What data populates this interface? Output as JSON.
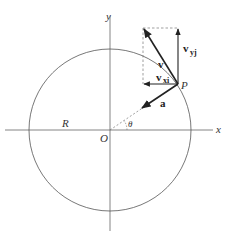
{
  "diagram": {
    "type": "circular-motion-vector-diagram",
    "colors": {
      "line": "#555555",
      "vector": "#222222",
      "dashed": "#777777",
      "background": "#ffffff"
    },
    "labels": {
      "x_axis": "x",
      "y_axis": "y",
      "origin": "O",
      "radius": "R",
      "angle": "θ",
      "point": "P",
      "velocity": "v",
      "velocity_x": {
        "main": "v",
        "sub": "xi"
      },
      "velocity_y": {
        "main": "v",
        "sub": "yj"
      },
      "acceleration": "a"
    }
  }
}
